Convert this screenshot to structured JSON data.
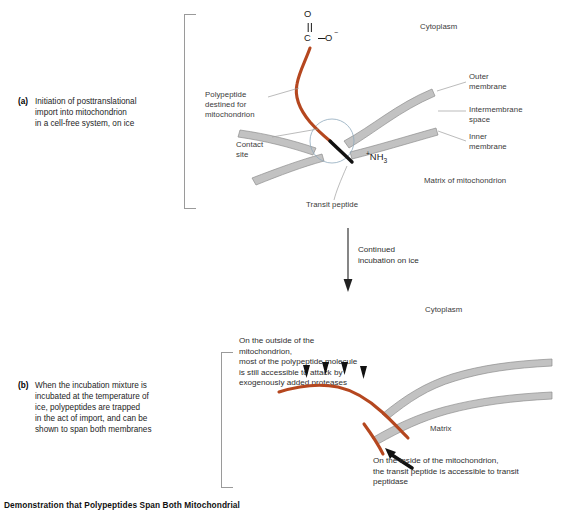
{
  "caption": {
    "number": "",
    "text": "Demonstration that Polypeptides Span Both Mitochondrial"
  },
  "panel_a": {
    "tag": "(a)",
    "description": "Initiation of posttranslational\nimport into mitochondrion\nin a cell-free system, on ice",
    "labels": {
      "cytoplasm": "Cytoplasm",
      "outer_membrane": "Outer\nmembrane",
      "intermembrane_space": "Intermembrane\nspace",
      "inner_membrane": "Inner\nmembrane",
      "matrix": "Matrix of mitochondrion",
      "polypeptide": "Polypeptide\ndestined for\nmitochondrion",
      "contact_site": "Contact\nsite",
      "transit_peptide": "Transit peptide",
      "carboxyl_o": "O",
      "carboxyl_c": "C",
      "carboxyl_o_minus": "O",
      "carboxyl_charge": "−",
      "amino_group": "NH",
      "amino_sub": "3",
      "amino_charge": "+"
    }
  },
  "transition": {
    "text": "Continued\nincubation on ice"
  },
  "panel_b": {
    "tag": "(b)",
    "description": "When the incubation mixture is\nincubated at the temperature of\nice, polypeptides are trapped\nin the act of import, and can be\nshown to span both membranes",
    "labels": {
      "cytoplasm": "Cytoplasm",
      "matrix": "Matrix",
      "outside_note": "On the outside of the\nmitochondrion,\nmost of the polypeptide molecule\nis still accessible to attack by\nexogenously added proteases",
      "inside_note": "On the inside of the mitochondrion,\nthe transit peptide is accessible to transit\npeptidase"
    },
    "protease_arrow_count": 4
  },
  "colors": {
    "polypeptide": "#b5471f",
    "transit_peptide": "#111111",
    "membrane_fill": "#c2c2c2",
    "membrane_stroke": "#8e8e8e",
    "leader": "#9d9d9d",
    "contact_circle": "#8fa9bd"
  }
}
